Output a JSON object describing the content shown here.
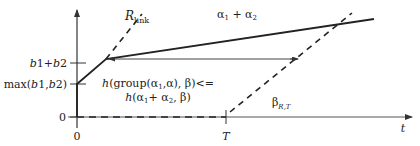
{
  "diagram": {
    "type": "network-calculus-curves",
    "axes": {
      "x_label": "t",
      "y_ticks": [
        {
          "label": "b1+b2",
          "y": 63
        },
        {
          "label": "max(b1,b2)",
          "y": 84
        },
        {
          "label": "0",
          "y": 117
        }
      ],
      "x_ticks": [
        {
          "label": "0",
          "x": 77
        },
        {
          "label": "T",
          "x": 226
        }
      ]
    },
    "curves": {
      "r_link": {
        "label_main": "R",
        "label_sub": "link",
        "style": "dashed"
      },
      "alpha_sum": {
        "label": "α₁ + α₂",
        "label_main": "α",
        "sub1": "1",
        "plus": " + α",
        "sub2": "2",
        "style": "solid"
      },
      "beta": {
        "label_main": "β",
        "label_sub": "R,T",
        "style": "dashed"
      }
    },
    "annotation": {
      "line1": "h(group(α₁,α), β)<=",
      "line2": "h(α₁+ α₂, β)"
    },
    "colors": {
      "stroke": "#222222",
      "thin_stroke": "#444444",
      "background": "#ffffff"
    }
  }
}
